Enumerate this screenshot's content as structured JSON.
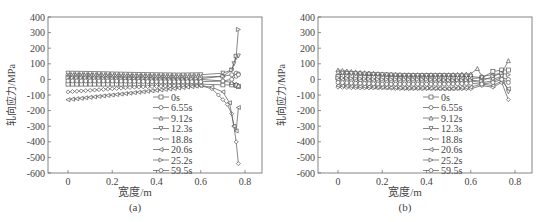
{
  "chart_data": [
    {
      "type": "line",
      "panel_label": "(a)",
      "xlabel": "宽度/m",
      "ylabel": "轧向应力/MPa",
      "xlim": [
        -0.08,
        0.88
      ],
      "ylim": [
        -600,
        400
      ],
      "xticks": [
        0,
        0.2,
        0.4,
        0.6,
        0.8
      ],
      "yticks": [
        400,
        300,
        200,
        100,
        0,
        -100,
        -200,
        -300,
        -400,
        -500,
        -600
      ],
      "grid": false,
      "legend_position": "lower center-right",
      "series": [
        {
          "name": "0s",
          "marker": "square",
          "x": [
            0,
            0.1,
            0.2,
            0.3,
            0.4,
            0.5,
            0.6,
            0.7,
            0.74,
            0.76,
            0.77
          ],
          "y": [
            -30,
            -30,
            -30,
            -30,
            -30,
            -30,
            -30,
            -35,
            -35,
            -40,
            -45
          ]
        },
        {
          "name": "6.55s",
          "marker": "circle",
          "x": [
            0,
            0.1,
            0.2,
            0.3,
            0.4,
            0.5,
            0.6,
            0.7,
            0.74,
            0.76,
            0.77
          ],
          "y": [
            30,
            28,
            25,
            22,
            20,
            18,
            15,
            20,
            30,
            40,
            35
          ]
        },
        {
          "name": "9.12s",
          "marker": "triangle-up",
          "x": [
            0,
            0.1,
            0.2,
            0.3,
            0.4,
            0.5,
            0.6,
            0.7,
            0.74,
            0.76,
            0.77
          ],
          "y": [
            20,
            18,
            15,
            12,
            10,
            5,
            0,
            -10,
            -20,
            -30,
            -40
          ]
        },
        {
          "name": "12.3s",
          "marker": "triangle-down",
          "x": [
            0,
            0.1,
            0.2,
            0.3,
            0.4,
            0.5,
            0.6,
            0.7,
            0.74,
            0.75,
            0.76,
            0.77
          ],
          "y": [
            40,
            38,
            35,
            32,
            30,
            28,
            30,
            40,
            60,
            100,
            140,
            150
          ]
        },
        {
          "name": "18.8s",
          "marker": "diamond",
          "x": [
            0,
            0.1,
            0.2,
            0.3,
            0.4,
            0.5,
            0.6,
            0.65,
            0.68,
            0.7,
            0.72,
            0.74,
            0.75,
            0.76,
            0.77
          ],
          "y": [
            -80,
            -70,
            -60,
            -50,
            -45,
            -40,
            -40,
            -60,
            -100,
            -130,
            -160,
            -220,
            -300,
            -400,
            -540
          ]
        },
        {
          "name": "20.6s",
          "marker": "triangle-left",
          "x": [
            0,
            0.1,
            0.2,
            0.3,
            0.4,
            0.5,
            0.6,
            0.65,
            0.7,
            0.73,
            0.75,
            0.76,
            0.77
          ],
          "y": [
            -130,
            -115,
            -100,
            -85,
            -70,
            -55,
            -40,
            -50,
            -80,
            -150,
            -300,
            -330,
            -180
          ]
        },
        {
          "name": "25.2s",
          "marker": "triangle-right",
          "x": [
            0,
            0.1,
            0.2,
            0.3,
            0.4,
            0.5,
            0.6,
            0.7,
            0.74,
            0.76,
            0.77
          ],
          "y": [
            10,
            8,
            5,
            3,
            0,
            0,
            5,
            20,
            60,
            150,
            320
          ]
        },
        {
          "name": "59.5s",
          "marker": "circle",
          "x": [
            0,
            0.1,
            0.2,
            0.3,
            0.4,
            0.5,
            0.6,
            0.7,
            0.74,
            0.76,
            0.77
          ],
          "y": [
            -10,
            -10,
            -10,
            -12,
            -15,
            -15,
            -15,
            -10,
            0,
            20,
            30
          ]
        }
      ]
    },
    {
      "type": "line",
      "panel_label": "(b)",
      "xlabel": "宽度/m",
      "ylabel": "轧向应力/MPa",
      "xlim": [
        -0.08,
        0.88
      ],
      "ylim": [
        -600,
        400
      ],
      "xticks": [
        0,
        0.2,
        0.4,
        0.6,
        0.8
      ],
      "yticks": [
        400,
        300,
        200,
        100,
        0,
        -100,
        -200,
        -300,
        -400,
        -500,
        -600
      ],
      "grid": false,
      "legend_position": "lower center-right",
      "series": [
        {
          "name": "0s",
          "marker": "square",
          "x": [
            0,
            0.1,
            0.2,
            0.3,
            0.4,
            0.5,
            0.6,
            0.65,
            0.7,
            0.74,
            0.77
          ],
          "y": [
            20,
            15,
            10,
            8,
            5,
            5,
            5,
            10,
            50,
            60,
            60
          ]
        },
        {
          "name": "6.55s",
          "marker": "circle",
          "x": [
            0,
            0.1,
            0.2,
            0.3,
            0.4,
            0.5,
            0.6,
            0.65,
            0.7,
            0.74,
            0.77
          ],
          "y": [
            0,
            -5,
            -10,
            -10,
            -10,
            -10,
            -10,
            -20,
            -10,
            10,
            0
          ]
        },
        {
          "name": "9.12s",
          "marker": "triangle-up",
          "x": [
            0,
            0.1,
            0.2,
            0.3,
            0.4,
            0.5,
            0.6,
            0.63,
            0.65,
            0.7,
            0.74,
            0.77
          ],
          "y": [
            60,
            45,
            35,
            30,
            30,
            30,
            35,
            70,
            20,
            30,
            40,
            120
          ]
        },
        {
          "name": "12.3s",
          "marker": "triangle-down",
          "x": [
            0,
            0.1,
            0.2,
            0.3,
            0.4,
            0.5,
            0.6,
            0.65,
            0.7,
            0.74,
            0.77
          ],
          "y": [
            40,
            35,
            30,
            25,
            25,
            25,
            20,
            10,
            0,
            20,
            -80
          ]
        },
        {
          "name": "18.8s",
          "marker": "diamond",
          "x": [
            0,
            0.1,
            0.2,
            0.3,
            0.4,
            0.5,
            0.6,
            0.65,
            0.7,
            0.74,
            0.77
          ],
          "y": [
            -50,
            -55,
            -55,
            -60,
            -60,
            -60,
            -60,
            -40,
            -50,
            -20,
            -130
          ]
        },
        {
          "name": "20.6s",
          "marker": "triangle-left",
          "x": [
            0,
            0.1,
            0.2,
            0.3,
            0.4,
            0.5,
            0.6,
            0.65,
            0.7,
            0.74,
            0.77
          ],
          "y": [
            -40,
            -45,
            -50,
            -55,
            -55,
            -60,
            -50,
            -30,
            -40,
            -10,
            -60
          ]
        },
        {
          "name": "25.2s",
          "marker": "triangle-right",
          "x": [
            0,
            0.1,
            0.2,
            0.3,
            0.4,
            0.5,
            0.6,
            0.65,
            0.7,
            0.74,
            0.77
          ],
          "y": [
            10,
            5,
            0,
            0,
            0,
            -5,
            -5,
            -10,
            20,
            40,
            30
          ]
        },
        {
          "name": "59.5s",
          "marker": "circle",
          "x": [
            0,
            0.1,
            0.2,
            0.3,
            0.4,
            0.5,
            0.6,
            0.65,
            0.7,
            0.74,
            0.77
          ],
          "y": [
            -20,
            -25,
            -30,
            -30,
            -30,
            -30,
            -25,
            -30,
            -20,
            0,
            -20
          ]
        }
      ]
    }
  ]
}
